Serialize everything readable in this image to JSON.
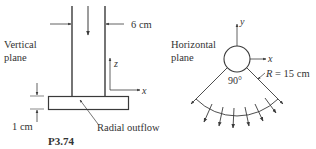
{
  "figure_id": "P3.74",
  "vertical_view": {
    "label_line1": "Vertical",
    "label_line2": "plane",
    "pipe_width_label": "6 cm",
    "gap_label": "1 cm",
    "outflow_label": "Radial outflow",
    "axis_z": "z",
    "axis_x": "x"
  },
  "horizontal_view": {
    "label_line1": "Horizontal",
    "label_line2": "plane",
    "angle_label": "90°",
    "radius_label_var": "R",
    "radius_label_value": " = 15 cm",
    "axis_y": "y",
    "axis_x": "x"
  },
  "colors": {
    "line": "#3a3a3a",
    "text": "#333333"
  }
}
